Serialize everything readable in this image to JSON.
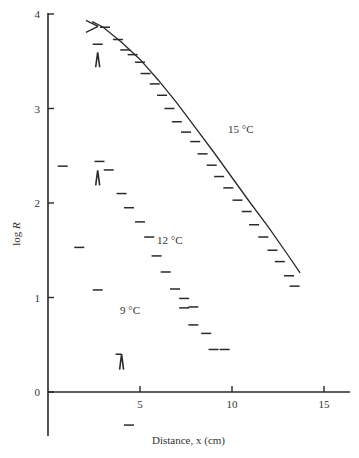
{
  "chart_data": {
    "type": "scatter",
    "title": "",
    "xlabel": "Distance, x (cm)",
    "ylabel": "log R",
    "xlim": [
      0,
      16
    ],
    "ylim": [
      -0.5,
      4
    ],
    "x_ticks": [
      5,
      10,
      15
    ],
    "x_tick_labels": [
      "5",
      "10",
      "15"
    ],
    "y_ticks": [
      0,
      1,
      2,
      3,
      4
    ],
    "y_tick_labels": [
      "0",
      "1",
      "2",
      "3",
      "4"
    ],
    "grid": false,
    "legend": "none (inline labels)",
    "marker": "short horizontal dash",
    "series": [
      {
        "name": "15 °C",
        "label_position": {
          "x": 9.9,
          "y": 2.95
        },
        "has_fit_curve": true,
        "fit_curve": {
          "x": [
            2.4,
            3.0,
            4.0,
            5.0,
            6.0,
            7.0,
            8.0,
            9.0,
            10.0,
            11.0,
            12.0,
            13.0,
            13.7
          ],
          "y": [
            3.92,
            3.86,
            3.7,
            3.52,
            3.3,
            3.06,
            2.8,
            2.54,
            2.27,
            2.0,
            1.74,
            1.46,
            1.26
          ]
        },
        "x": [
          3.1,
          3.8,
          4.2,
          4.6,
          5.0,
          5.3,
          5.8,
          6.2,
          6.6,
          7.0,
          7.5,
          8.0,
          8.4,
          8.9,
          9.3,
          9.8,
          10.3,
          10.8,
          11.2,
          11.7,
          12.2,
          12.6,
          13.1,
          13.4
        ],
        "y": [
          3.86,
          3.73,
          3.62,
          3.57,
          3.49,
          3.37,
          3.26,
          3.14,
          3.0,
          2.86,
          2.75,
          2.65,
          2.52,
          2.4,
          2.28,
          2.16,
          2.03,
          1.91,
          1.77,
          1.64,
          1.5,
          1.38,
          1.23,
          1.12
        ]
      },
      {
        "name": "12 °C",
        "label_position": {
          "x": 6.0,
          "y": 1.65
        },
        "has_fit_curve": false,
        "x": [
          2.8,
          3.3,
          4.0,
          4.4,
          5.0,
          5.5,
          5.9,
          6.4,
          6.9,
          7.4,
          7.9
        ],
        "y": [
          2.44,
          2.35,
          2.1,
          1.95,
          1.8,
          1.64,
          1.44,
          1.27,
          1.09,
          0.99,
          0.9
        ]
      },
      {
        "name": "9 °C",
        "label_position": {
          "x": 5.1,
          "y": 0.88
        },
        "has_fit_curve": false,
        "x": [
          0.8,
          1.7,
          2.7,
          4.4,
          7.4,
          7.9,
          8.6,
          9.0,
          9.6
        ],
        "y": [
          2.39,
          1.53,
          1.08,
          -0.35,
          0.89,
          0.71,
          0.62,
          0.45,
          0.45
        ]
      }
    ],
    "annotations": [
      {
        "type": "arrow-wedge",
        "x": 2.7,
        "y": 3.5,
        "description": "upward wedge marker below dash at 3.68"
      },
      {
        "type": "dash",
        "x": 2.7,
        "y": 3.68
      },
      {
        "type": "arrow-wedge",
        "x": 2.7,
        "y": 2.25,
        "description": "upward wedge marker below dash at 2.44"
      },
      {
        "type": "arrow-wedge-with-bar",
        "x": 4.0,
        "y": 0.3,
        "description": "wedge marker with horizontal bar at ~0.4"
      },
      {
        "type": "cross",
        "x": 2.5,
        "y": 3.88,
        "description": "X-shaped start point on 15 °C curve"
      }
    ]
  },
  "labels": {
    "series_15": "15 °C",
    "series_12": "12 °C",
    "series_9": "9 °C",
    "xlabel": "Distance, x (cm)",
    "ylabel_prefix": "log ",
    "ylabel_var": "R"
  }
}
